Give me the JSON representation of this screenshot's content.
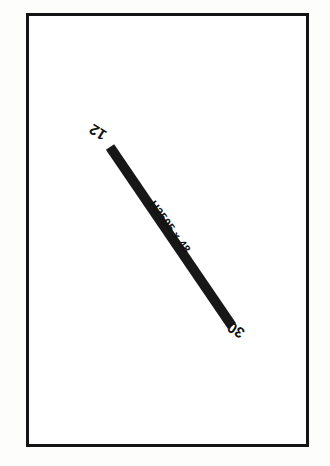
{
  "sheet": {
    "background_color": "#fdfdfc",
    "paper_color": "#ffffff",
    "frame_color": "#141414",
    "ink_color": "#111111"
  },
  "drawing": {
    "type": "structural-beam-elevation",
    "member": {
      "size_label": "H2505 x 48",
      "graphic_name": "diagonal-beam-member",
      "fill_color": "#171717",
      "start_point": [
        110,
        147
      ],
      "end_point": [
        232,
        326
      ],
      "thickness_px": 10
    },
    "end_marks": [
      {
        "name": "start-end-mark",
        "text": "12",
        "rotation_deg": 212
      },
      {
        "name": "finish-end-mark",
        "text": "30",
        "rotation_deg": 212
      }
    ],
    "callout": {
      "name": "member-size-callout",
      "text": "H2505 x 48",
      "rotation_deg": 54
    }
  }
}
